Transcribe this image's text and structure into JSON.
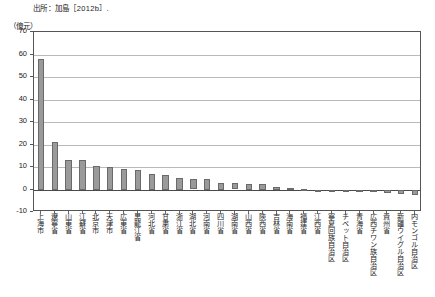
{
  "source_note": "出所：加島［2012b］.",
  "unit_label": "（億元）",
  "chart_data": {
    "type": "bar",
    "title": "",
    "subtitle": "",
    "xlabel": "",
    "ylabel": "（億元）",
    "ylim": [
      -10,
      70
    ],
    "ytick_step": 10,
    "yticks": [
      70,
      60,
      50,
      40,
      30,
      20,
      10,
      0,
      -10
    ],
    "grid": true,
    "legend": "none",
    "bar_color": "#9a9a9a",
    "bar_edge_color": "#6a6a6a",
    "categories": [
      "上海市",
      "遼寧省",
      "山東省",
      "江蘇省",
      "北京市",
      "天津市",
      "広東省",
      "黒龍江省",
      "河北省",
      "甘粛省",
      "浙江省",
      "湖北省",
      "河南省",
      "四川省",
      "湖南省",
      "山西省",
      "陝西省",
      "吉林省",
      "海南省",
      "福建省",
      "江西省",
      "寧夏回族自治区",
      "チベット自治区",
      "青海省",
      "広西チワン族自治区",
      "貴州省",
      "新疆ウイグル自治区",
      "内モンゴル自治区"
    ],
    "values": [
      58.0,
      21.0,
      13.0,
      13.0,
      10.5,
      10.0,
      9.0,
      8.5,
      7.0,
      6.5,
      5.0,
      4.8,
      4.5,
      3.0,
      2.8,
      2.5,
      2.5,
      1.0,
      0.6,
      0.2,
      -0.2,
      -0.5,
      -0.8,
      -1.0,
      -1.2,
      -1.4,
      -2.0,
      -2.5
    ]
  }
}
